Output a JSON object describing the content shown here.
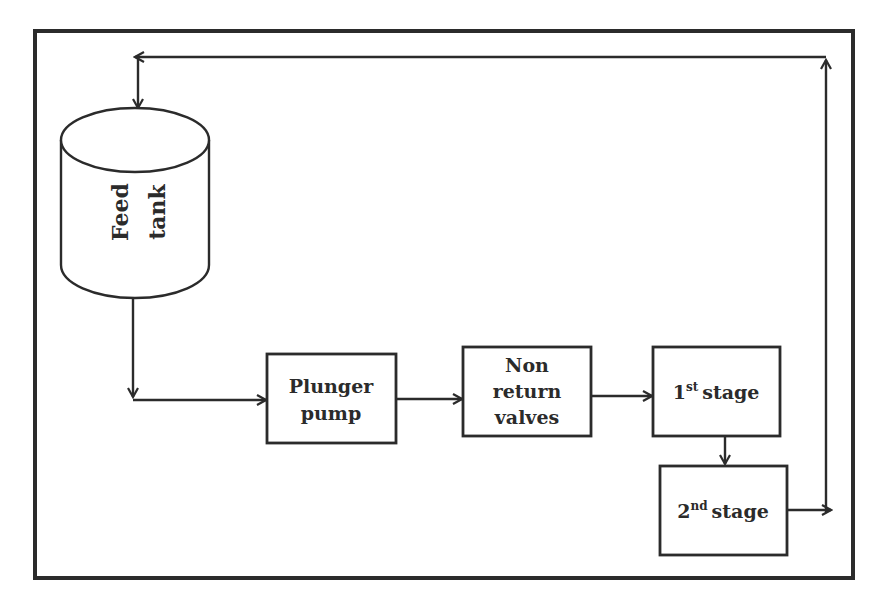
{
  "diagram": {
    "type": "process-flow",
    "colors": {
      "stroke": "#2b2b2b",
      "background": "#ffffff"
    },
    "nodes": {
      "feed_tank": {
        "line1": "Feed",
        "line2": "tank",
        "shape": "cylinder"
      },
      "plunger_pump": {
        "line1": "Plunger",
        "line2": "pump"
      },
      "non_return_valves": {
        "line1": "Non",
        "line2": "return",
        "line3": "valves"
      },
      "stage1": {
        "num": "1",
        "sup": "st",
        "text": "stage"
      },
      "stage2": {
        "num": "2",
        "sup": "nd",
        "text": "stage"
      }
    },
    "edges": [
      {
        "from": "feed_tank",
        "to": "plunger_pump"
      },
      {
        "from": "plunger_pump",
        "to": "non_return_valves"
      },
      {
        "from": "non_return_valves",
        "to": "stage1"
      },
      {
        "from": "stage1",
        "to": "stage2"
      },
      {
        "from": "stage2",
        "to": "feed_tank",
        "label": "return loop"
      }
    ]
  }
}
